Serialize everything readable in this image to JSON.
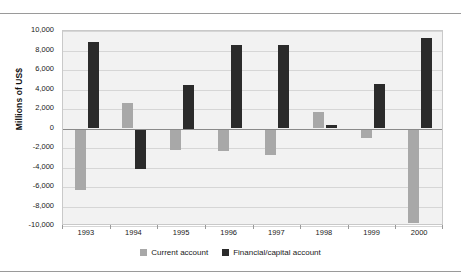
{
  "chart_data": {
    "type": "bar",
    "title": "",
    "subtitle": "",
    "xlabel": "",
    "ylabel": "Millions of US$",
    "categories": [
      "1993",
      "1994",
      "1995",
      "1996",
      "1997",
      "1998",
      "1999",
      "2000"
    ],
    "series": [
      {
        "name": "Current account",
        "color": "#a8a8a8",
        "values": [
          -6300,
          2600,
          -2200,
          -2300,
          -2700,
          1700,
          -1000,
          -9700
        ]
      },
      {
        "name": "Financial/capital account",
        "color": "#2b2b2b",
        "values": [
          8900,
          -4200,
          4500,
          8600,
          8600,
          400,
          4600,
          9300
        ]
      }
    ],
    "ylim": [
      -10000,
      10000
    ],
    "yticks": [
      10000,
      8000,
      6000,
      4000,
      2000,
      0,
      -2000,
      -4000,
      -6000,
      -8000,
      -10000
    ],
    "ytick_labels": [
      "10,000",
      "8,000",
      "6,000",
      "4,000",
      "2,000",
      "0",
      "-2,000",
      "-4,000",
      "-6,000",
      "-8,000",
      "-10,000"
    ],
    "grid": true,
    "legend_position": "bottom",
    "plot_background": "#f2f2f2",
    "gridline_color": "#d6d6d6",
    "zeroline_color": "#8a8a8a"
  },
  "legend": {
    "items": [
      {
        "label": "Current account",
        "color": "#a8a8a8"
      },
      {
        "label": "Financial/capital account",
        "color": "#2b2b2b"
      }
    ]
  },
  "axis": {
    "y_title": "Millions of US$"
  }
}
